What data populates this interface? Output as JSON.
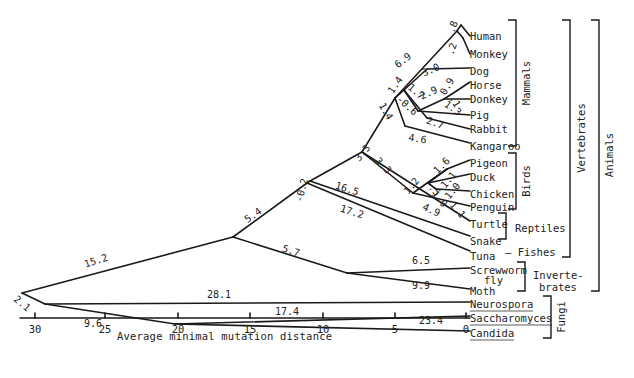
{
  "diagram": {
    "type": "phylogenetic-tree",
    "axis": {
      "label": "Average minimal mutation distance",
      "ticks": [
        {
          "value": "30",
          "x": 35
        },
        {
          "value": "25",
          "x": 105
        },
        {
          "value": "20",
          "x": 178
        },
        {
          "value": "15",
          "x": 250
        },
        {
          "value": "10",
          "x": 323
        },
        {
          "value": "5",
          "x": 395
        },
        {
          "value": "0",
          "x": 466
        }
      ],
      "y": 318
    },
    "taxa": [
      {
        "name": "Human",
        "x": 470,
        "y": 36
      },
      {
        "name": "Monkey",
        "x": 470,
        "y": 54
      },
      {
        "name": "Dog",
        "x": 470,
        "y": 71
      },
      {
        "name": "Horse",
        "x": 470,
        "y": 85
      },
      {
        "name": "Donkey",
        "x": 470,
        "y": 99
      },
      {
        "name": "Pig",
        "x": 470,
        "y": 115
      },
      {
        "name": "Rabbit",
        "x": 470,
        "y": 129
      },
      {
        "name": "Kangaroo",
        "x": 470,
        "y": 146
      },
      {
        "name": "Pigeon",
        "x": 470,
        "y": 163
      },
      {
        "name": "Duck",
        "x": 470,
        "y": 177
      },
      {
        "name": "Chicken",
        "x": 470,
        "y": 194
      },
      {
        "name": "Penguin",
        "x": 470,
        "y": 207
      },
      {
        "name": "Turtle",
        "x": 470,
        "y": 224
      },
      {
        "name": "Snake",
        "x": 470,
        "y": 241
      },
      {
        "name": "Tuna",
        "x": 470,
        "y": 256
      },
      {
        "name": "Screwworm",
        "x": 470,
        "y": 270
      },
      {
        "name": "fly",
        "x": 484,
        "y": 280
      },
      {
        "name": "Moth",
        "x": 470,
        "y": 291
      },
      {
        "name": "Neurospora",
        "x": 470,
        "y": 304,
        "underline": true
      },
      {
        "name": "Saccharomyces",
        "x": 470,
        "y": 318,
        "underline": true
      },
      {
        "name": "Candida",
        "x": 470,
        "y": 333,
        "underline": true
      }
    ],
    "branch_lengths": [
      {
        "value": ".8",
        "x": 456,
        "y": 28,
        "rot": -70
      },
      {
        "value": ".2",
        "x": 455,
        "y": 50,
        "rot": -70
      },
      {
        "value": "6.9",
        "x": 405,
        "y": 63,
        "rot": -38
      },
      {
        "value": "3.0",
        "x": 432,
        "y": 73,
        "rot": -22
      },
      {
        "value": "1.4",
        "x": 398,
        "y": 87,
        "rot": -55
      },
      {
        "value": "1.7",
        "x": 414,
        "y": 94,
        "rot": 40
      },
      {
        "value": "2.9",
        "x": 430,
        "y": 96,
        "rot": -25
      },
      {
        "value": "0.9",
        "x": 450,
        "y": 88,
        "rot": -60
      },
      {
        "value": ".1",
        "x": 452,
        "y": 103,
        "rot": 60
      },
      {
        "value": "1.3",
        "x": 451,
        "y": 111,
        "rot": 35
      },
      {
        "value": "-0.6",
        "x": 405,
        "y": 108,
        "rot": 42
      },
      {
        "value": "2.7",
        "x": 434,
        "y": 126,
        "rot": 20
      },
      {
        "value": "1.4",
        "x": 383,
        "y": 113,
        "rot": 60
      },
      {
        "value": "4.6",
        "x": 417,
        "y": 142,
        "rot": 10
      },
      {
        "value": "3.3",
        "x": 365,
        "y": 155,
        "rot": -50
      },
      {
        "value": "3.3",
        "x": 381,
        "y": 168,
        "rot": 45
      },
      {
        "value": "1.6",
        "x": 444,
        "y": 168,
        "rot": -45
      },
      {
        "value": "1.1",
        "x": 451,
        "y": 182,
        "rot": -50
      },
      {
        "value": "1.0",
        "x": 455,
        "y": 193,
        "rot": -50
      },
      {
        "value": "1.2",
        "x": 414,
        "y": 188,
        "rot": -50
      },
      {
        "value": ".5",
        "x": 432,
        "y": 192,
        "rot": 50
      },
      {
        "value": "1.0",
        "x": 437,
        "y": 201,
        "rot": 50
      },
      {
        "value": "1.1",
        "x": 455,
        "y": 212,
        "rot": 50
      },
      {
        "value": "4.9",
        "x": 430,
        "y": 213,
        "rot": 25
      },
      {
        "value": "-0.2",
        "x": 305,
        "y": 191,
        "rot": -75
      },
      {
        "value": "16.5",
        "x": 346,
        "y": 192,
        "rot": 18
      },
      {
        "value": "17.2",
        "x": 351,
        "y": 215,
        "rot": 18
      },
      {
        "value": "5.4",
        "x": 255,
        "y": 218,
        "rot": -35
      },
      {
        "value": "5.7",
        "x": 290,
        "y": 254,
        "rot": 18
      },
      {
        "value": "6.5",
        "x": 421,
        "y": 264,
        "rot": 0
      },
      {
        "value": "9.9",
        "x": 421,
        "y": 289,
        "rot": 0
      },
      {
        "value": "15.2",
        "x": 97,
        "y": 264,
        "rot": -18
      },
      {
        "value": "28.1",
        "x": 219,
        "y": 298,
        "rot": 0
      },
      {
        "value": "17.4",
        "x": 287,
        "y": 315,
        "rot": 0
      },
      {
        "value": "23.4",
        "x": 431,
        "y": 324,
        "rot": 0
      },
      {
        "value": "9.6",
        "x": 93,
        "y": 327,
        "rot": 0
      },
      {
        "value": "2.1",
        "x": 20,
        "y": 306,
        "rot": 40
      }
    ],
    "groups": [
      {
        "name": "Mammals",
        "bracket": {
          "x": 516,
          "y1": 20,
          "y2": 146
        },
        "label_x": 530,
        "label_y": 83,
        "vertical": true
      },
      {
        "name": "Birds",
        "bracket": {
          "x": 516,
          "y1": 153,
          "y2": 209
        },
        "label_x": 530,
        "label_y": 181,
        "vertical": true
      },
      {
        "name": "Reptiles",
        "bracket": {
          "x": 506,
          "y1": 213,
          "y2": 239
        },
        "label_x": 515,
        "label_y": 232,
        "vertical": false
      },
      {
        "name": "— Fishes",
        "bracket": null,
        "label_x": 505,
        "label_y": 256,
        "vertical": false
      },
      {
        "name": "Vertebrates",
        "bracket": {
          "x": 570,
          "y1": 20,
          "y2": 257
        },
        "label_x": 585,
        "label_y": 138,
        "vertical": true
      },
      {
        "name": "Inverte-",
        "bracket": {
          "x": 525,
          "y1": 262,
          "y2": 291
        },
        "label_x": 533,
        "label_y": 279,
        "vertical": false
      },
      {
        "name": "brates",
        "bracket": null,
        "label_x": 539,
        "label_y": 291,
        "vertical": false
      },
      {
        "name": "Animals",
        "bracket": {
          "x": 599,
          "y1": 20,
          "y2": 291
        },
        "label_x": 613,
        "label_y": 155,
        "vertical": true
      },
      {
        "name": "Fungi",
        "bracket": {
          "x": 551,
          "y1": 296,
          "y2": 338
        },
        "label_x": 565,
        "label_y": 317,
        "vertical": true
      }
    ],
    "edges": [
      [
        22,
        293,
        233,
        237
      ],
      [
        22,
        293,
        45,
        304
      ],
      [
        233,
        237,
        307,
        183
      ],
      [
        233,
        237,
        347,
        273
      ],
      [
        307,
        183,
        310,
        181
      ],
      [
        310,
        181,
        362,
        152
      ],
      [
        310,
        181,
        470,
        236
      ],
      [
        307,
        183,
        470,
        251
      ],
      [
        347,
        273,
        470,
        268
      ],
      [
        347,
        273,
        470,
        289
      ],
      [
        45,
        304,
        470,
        302
      ],
      [
        45,
        304,
        175,
        324
      ],
      [
        175,
        324,
        470,
        316
      ],
      [
        175,
        324,
        470,
        331
      ],
      [
        362,
        152,
        395,
        98
      ],
      [
        362,
        152,
        413,
        193
      ],
      [
        395,
        98,
        457,
        31
      ],
      [
        457,
        31,
        461,
        25
      ],
      [
        457,
        31,
        463,
        38
      ],
      [
        463,
        38,
        470,
        54
      ],
      [
        461,
        25,
        470,
        36
      ],
      [
        395,
        98,
        404,
        90
      ],
      [
        404,
        90,
        427,
        69
      ],
      [
        427,
        69,
        470,
        68
      ],
      [
        404,
        90,
        418,
        111
      ],
      [
        418,
        111,
        444,
        99
      ],
      [
        444,
        99,
        458,
        90
      ],
      [
        458,
        90,
        470,
        82
      ],
      [
        444,
        99,
        470,
        99
      ],
      [
        418,
        111,
        470,
        115
      ],
      [
        404,
        90,
        427,
        118
      ],
      [
        427,
        118,
        470,
        129
      ],
      [
        395,
        98,
        405,
        126
      ],
      [
        405,
        126,
        470,
        143
      ],
      [
        413,
        193,
        447,
        169
      ],
      [
        447,
        169,
        470,
        160
      ],
      [
        428,
        183,
        470,
        174
      ],
      [
        447,
        169,
        428,
        183
      ],
      [
        436,
        189,
        470,
        191
      ],
      [
        428,
        183,
        436,
        189
      ],
      [
        413,
        193,
        470,
        206
      ],
      [
        362,
        152,
        470,
        221
      ]
    ]
  }
}
